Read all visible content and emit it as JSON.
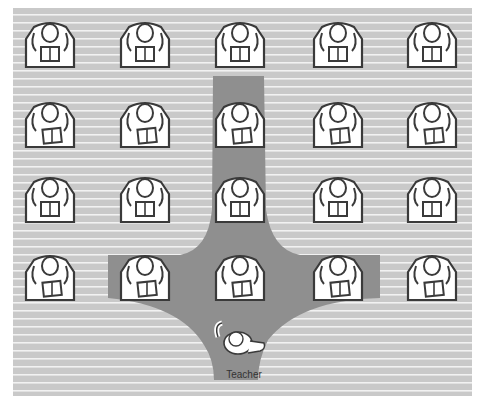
{
  "diagram": {
    "teacher_label": "Teacher",
    "rows": 4,
    "columns": 5,
    "students": [
      {
        "row": 1,
        "col": 1,
        "pose": "reading-up"
      },
      {
        "row": 1,
        "col": 2,
        "pose": "reading-up"
      },
      {
        "row": 1,
        "col": 3,
        "pose": "reading-up"
      },
      {
        "row": 1,
        "col": 4,
        "pose": "reading-up"
      },
      {
        "row": 1,
        "col": 5,
        "pose": "reading-up"
      },
      {
        "row": 2,
        "col": 1,
        "pose": "reading-down"
      },
      {
        "row": 2,
        "col": 2,
        "pose": "reading-down"
      },
      {
        "row": 2,
        "col": 3,
        "pose": "reading-down"
      },
      {
        "row": 2,
        "col": 4,
        "pose": "reading-down"
      },
      {
        "row": 2,
        "col": 5,
        "pose": "reading-down"
      },
      {
        "row": 3,
        "col": 1,
        "pose": "reading-up"
      },
      {
        "row": 3,
        "col": 2,
        "pose": "reading-up"
      },
      {
        "row": 3,
        "col": 3,
        "pose": "reading-up"
      },
      {
        "row": 3,
        "col": 4,
        "pose": "reading-up"
      },
      {
        "row": 3,
        "col": 5,
        "pose": "reading-up"
      },
      {
        "row": 4,
        "col": 1,
        "pose": "reading-down"
      },
      {
        "row": 4,
        "col": 2,
        "pose": "reading-down"
      },
      {
        "row": 4,
        "col": 3,
        "pose": "reading-down"
      },
      {
        "row": 4,
        "col": 4,
        "pose": "reading-down"
      },
      {
        "row": 4,
        "col": 5,
        "pose": "reading-down"
      }
    ],
    "highlighted_zone": "action zone: center column plus front row columns 2-4",
    "colors": {
      "floor": "#c9c9c9",
      "stripe": "#f2f2f2",
      "zone": "#8f8f8f",
      "desk_fill": "#ffffff",
      "outline": "#3a3a3a"
    }
  }
}
